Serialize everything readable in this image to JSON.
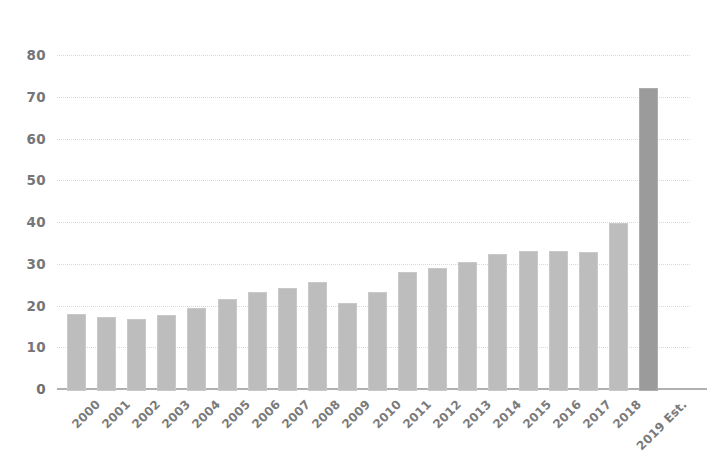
{
  "chart_data": {
    "type": "bar",
    "title": "",
    "subtitle": "",
    "xlabel": "",
    "ylabel": "",
    "ylim": [
      0,
      80
    ],
    "ytick_step": 10,
    "yticks": [
      80,
      70,
      60,
      50,
      40,
      30,
      20,
      10,
      0
    ],
    "grid": true,
    "legend": "none",
    "categories": [
      "2000",
      "2001",
      "2002",
      "2003",
      "2004",
      "2005",
      "2006",
      "2007",
      "2008",
      "2009",
      "2010",
      "2011",
      "2012",
      "2013",
      "2014",
      "2015",
      "2016",
      "2017",
      "2018",
      "2019 Est."
    ],
    "values": [
      18.5,
      17.8,
      17.2,
      18.2,
      19.8,
      22.0,
      23.6,
      24.6,
      26.0,
      21.0,
      23.8,
      28.6,
      29.4,
      30.8,
      32.8,
      33.6,
      33.6,
      33.4,
      40.2,
      72.5
    ],
    "highlight_index": 19,
    "colors": {
      "bar": "#bdbdbd",
      "bar_highlight": "#9b9b9b",
      "gridline": "#d8d8d8",
      "axis": "#b0b0b0",
      "tick_text": "#6f6f6f",
      "category_text": "#7a7a7a",
      "background": "#ffffff"
    }
  }
}
